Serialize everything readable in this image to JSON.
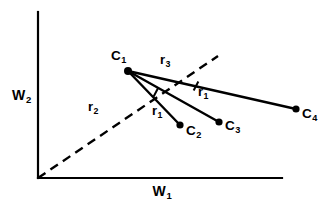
{
  "figure": {
    "background_color": "#ffffff",
    "ink_color": "#000000"
  },
  "axes": {
    "x_axis": {
      "name": "W",
      "subscript": "1",
      "label": "W1",
      "from": [
        38,
        178
      ],
      "to": [
        282,
        178
      ]
    },
    "y_axis": {
      "name": "W",
      "subscript": "2",
      "label": "W2",
      "from": [
        38,
        178
      ],
      "to": [
        38,
        12
      ]
    },
    "origin": [
      38,
      178
    ]
  },
  "points": [
    {
      "id": "C1",
      "name": "C",
      "subscript": "1",
      "x": 128,
      "y": 71,
      "label_x": 111,
      "label_y": 49,
      "radius": 4.0
    },
    {
      "id": "C2",
      "name": "C",
      "subscript": "2",
      "x": 180,
      "y": 125,
      "label_x": 186,
      "label_y": 124,
      "radius": 3.6
    },
    {
      "id": "C3",
      "name": "C",
      "subscript": "3",
      "x": 219,
      "y": 122,
      "label_x": 225,
      "label_y": 119,
      "radius": 3.6
    },
    {
      "id": "C4",
      "name": "C",
      "subscript": "4",
      "x": 296,
      "y": 109,
      "label_x": 302,
      "label_y": 107,
      "radius": 3.6
    }
  ],
  "solid_segments": [
    {
      "id": "C1-C2",
      "from": "C1",
      "to": "C2",
      "x1": 128,
      "y1": 71,
      "x2": 180,
      "y2": 125
    },
    {
      "id": "C1-C3",
      "from": "C1",
      "to": "C3",
      "x1": 128,
      "y1": 71,
      "x2": 219,
      "y2": 122
    },
    {
      "id": "C1-C4",
      "from": "C1",
      "to": "C4",
      "x1": 128,
      "y1": 71,
      "x2": 296,
      "y2": 109
    }
  ],
  "dashed_ray": {
    "id": "origin-ray",
    "from": [
      38,
      178
    ],
    "to": [
      218,
      56
    ],
    "dash_pattern": "9 6"
  },
  "tick_marks": [
    {
      "id": "tick-on-C1-C3",
      "x": 156,
      "y": 92,
      "angle": -62
    },
    {
      "id": "tick-on-C1-C4",
      "x": 196,
      "y": 86,
      "angle": -62
    }
  ],
  "distance_labels": [
    {
      "id": "r1-lower",
      "name": "r",
      "subscript": "1",
      "label": "r1",
      "x": 152,
      "y": 104
    },
    {
      "id": "r1-right",
      "name": "r",
      "subscript": "1",
      "label": "r1",
      "x": 198,
      "y": 85
    },
    {
      "id": "r2",
      "name": "r",
      "subscript": "2",
      "label": "r2",
      "x": 88,
      "y": 100
    },
    {
      "id": "r3",
      "name": "r",
      "subscript": "3",
      "label": "r3",
      "x": 160,
      "y": 53
    }
  ]
}
